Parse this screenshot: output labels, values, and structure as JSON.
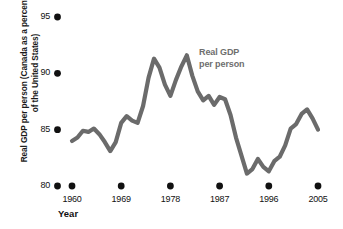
{
  "chart_data": {
    "type": "line",
    "title": "",
    "xlabel": "Year",
    "ylabel": "Real GDP per person (Canada as a percentage of the United States)",
    "annotation": {
      "line1": "Real GDP",
      "line2": "per person"
    },
    "series_name": "Real GDP per person",
    "line_color": "#6b6b6b",
    "tick_color": "#111111",
    "background": "#ffffff",
    "grid": false,
    "legend_position": "inline-annotation",
    "xlim": [
      1960,
      2005
    ],
    "ylim": [
      80,
      95
    ],
    "yticks": [
      80,
      85,
      90,
      95
    ],
    "ytick_labels": [
      "80",
      "85",
      "90",
      "95"
    ],
    "xticks": [
      1960,
      1969,
      1978,
      1987,
      1996,
      2005
    ],
    "xtick_labels": [
      "1960",
      "1969",
      "1978",
      "1987",
      "1996",
      "2005"
    ],
    "x": [
      1960,
      1961,
      1962,
      1963,
      1964,
      1965,
      1966,
      1967,
      1968,
      1969,
      1970,
      1971,
      1972,
      1973,
      1974,
      1975,
      1976,
      1977,
      1978,
      1979,
      1980,
      1981,
      1982,
      1983,
      1984,
      1985,
      1986,
      1987,
      1988,
      1989,
      1990,
      1991,
      1992,
      1993,
      1994,
      1995,
      1996,
      1997,
      1998,
      1999,
      2000,
      2001,
      2002,
      2003,
      2004,
      2005
    ],
    "values": [
      84.0,
      84.3,
      84.9,
      84.8,
      85.1,
      84.6,
      83.9,
      83.1,
      83.9,
      85.6,
      86.2,
      85.8,
      85.6,
      87.1,
      89.6,
      91.3,
      90.5,
      89.0,
      88.0,
      89.4,
      90.6,
      91.6,
      89.8,
      88.4,
      87.6,
      88.0,
      87.2,
      87.9,
      87.7,
      86.3,
      84.3,
      82.7,
      81.1,
      81.5,
      82.4,
      81.7,
      81.3,
      82.2,
      82.6,
      83.6,
      85.1,
      85.5,
      86.4,
      86.8,
      86.0,
      85.0
    ],
    "y_min_point": {
      "x": 1992,
      "y": 81.1
    },
    "y_max_point": {
      "x": 1981,
      "y": 91.6
    }
  }
}
